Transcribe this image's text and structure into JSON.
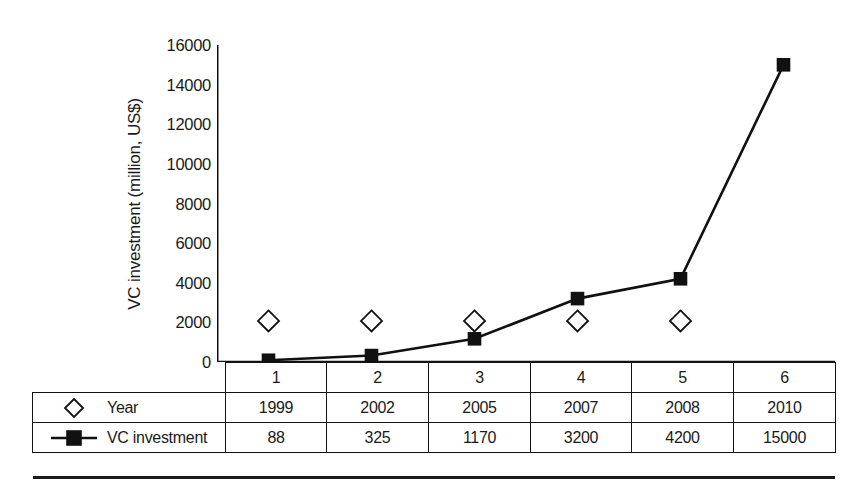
{
  "chart_data": {
    "type": "line",
    "title": "",
    "subtitle": "",
    "xlabel": "",
    "ylabel": "VC investment (million, US$)",
    "categories": [
      "1",
      "2",
      "3",
      "4",
      "5",
      "6"
    ],
    "ylim": [
      0,
      16000
    ],
    "yticks": [
      0,
      2000,
      4000,
      6000,
      8000,
      10000,
      12000,
      14000,
      16000
    ],
    "ytick_labels": [
      "0",
      "2000",
      "4000",
      "6000",
      "8000",
      "10000",
      "12000",
      "14000",
      "16000"
    ],
    "grid": false,
    "legend_position": "table-left",
    "series": [
      {
        "name": "Year",
        "marker": "open-diamond",
        "line": "none",
        "plotted_values": [
          2070,
          2070,
          2070,
          2070,
          2070,
          null
        ],
        "values": [
          1999,
          2002,
          2005,
          2007,
          2008,
          2010
        ]
      },
      {
        "name": "VC investment",
        "marker": "filled-square",
        "line": "solid",
        "values": [
          88,
          325,
          1170,
          3200,
          4200,
          15000
        ]
      }
    ]
  },
  "table": {
    "category_header_row": [
      "1",
      "2",
      "3",
      "4",
      "5",
      "6"
    ],
    "rows": [
      {
        "legend_label": "Year",
        "legend_marker": "open-diamond-icon",
        "cells": [
          "1999",
          "2002",
          "2005",
          "2007",
          "2008",
          "2010"
        ]
      },
      {
        "legend_label": "VC investment",
        "legend_marker": "line-square-icon",
        "cells": [
          "88",
          "325",
          "1170",
          "3200",
          "4200",
          "15000"
        ]
      }
    ]
  },
  "colors": {
    "ink": "#1a1a1a",
    "line": "#111111",
    "background": "#ffffff"
  }
}
